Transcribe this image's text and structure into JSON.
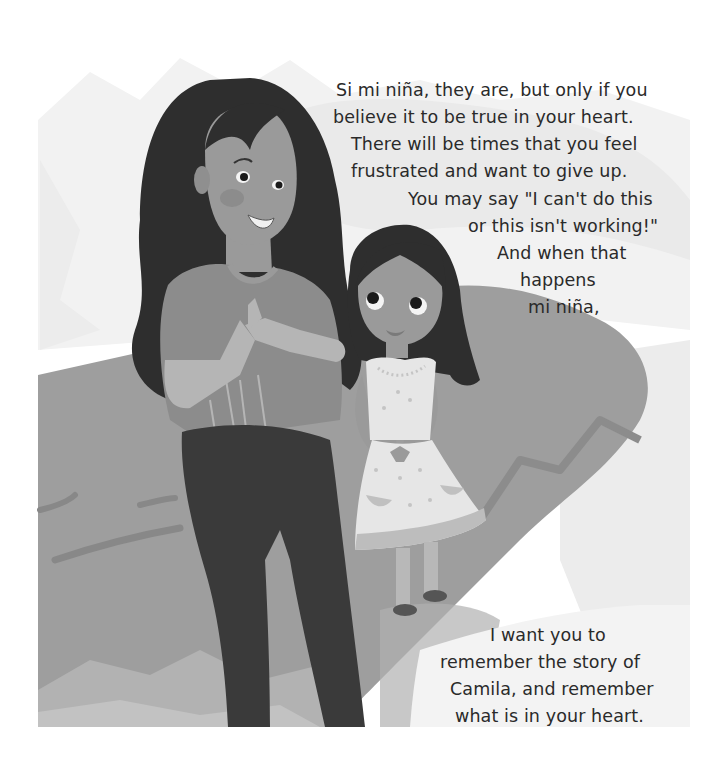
{
  "page": {
    "type": "storybook-page",
    "background_color": "#ffffff",
    "palette": {
      "hair": "#2e2e2e",
      "skin": "#9a9a9a",
      "skin_light": "#bdbdbd",
      "mother_top": "#8c8c8c",
      "pants": "#3a3a3a",
      "hill": "#9e9e9e",
      "hill_dark": "#8a8a8a",
      "dress": "#e6e6e6",
      "dress_band": "#bdbdbd",
      "text": "#2a2a2a"
    }
  },
  "illustration": {
    "characters": [
      "mother",
      "daughter"
    ],
    "description": "Mother with long dark hair clasping hands, smiling, standing beside young daughter in a white dress looking up at her, on a grey hill."
  },
  "text_top": {
    "lines": [
      "Si mi niña, they are, but only if you",
      "believe it to be true in your heart.",
      "There will be times that you feel",
      "frustrated and want to give up.",
      "You may say \"I can't do this",
      "or this isn't working!\"",
      "And when that",
      "happens",
      "mi niña,"
    ]
  },
  "text_bottom": {
    "lines": [
      "I want you to",
      "remember the story of",
      "Camila, and remember",
      "what is in your heart."
    ]
  }
}
